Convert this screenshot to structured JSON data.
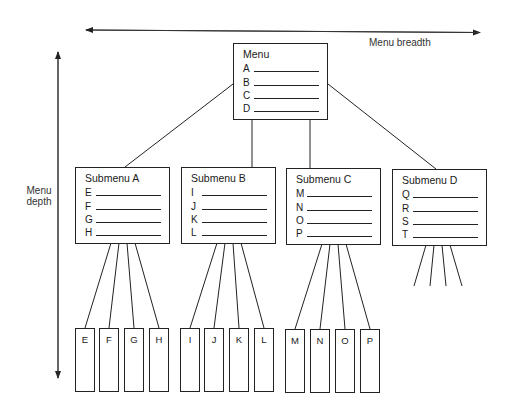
{
  "axes": {
    "breadth_label": "Menu breadth",
    "depth_label_line1": "Menu",
    "depth_label_line2": "depth"
  },
  "menu": {
    "title": "Menu",
    "items": [
      "A",
      "B",
      "C",
      "D"
    ]
  },
  "submenus": [
    {
      "title": "Submenu A",
      "items": [
        "E",
        "F",
        "G",
        "H"
      ]
    },
    {
      "title": "Submenu B",
      "items": [
        "I",
        "J",
        "K",
        "L"
      ]
    },
    {
      "title": "Submenu C",
      "items": [
        "M",
        "N",
        "O",
        "P"
      ]
    },
    {
      "title": "Submenu D",
      "items": [
        "Q",
        "R",
        "S",
        "T"
      ]
    }
  ],
  "leaves": [
    "E",
    "F",
    "G",
    "H",
    "I",
    "J",
    "K",
    "L",
    "M",
    "N",
    "O",
    "P"
  ],
  "colors": {
    "stroke": "#222222",
    "background": "#ffffff",
    "text": "#1a1a1a"
  }
}
